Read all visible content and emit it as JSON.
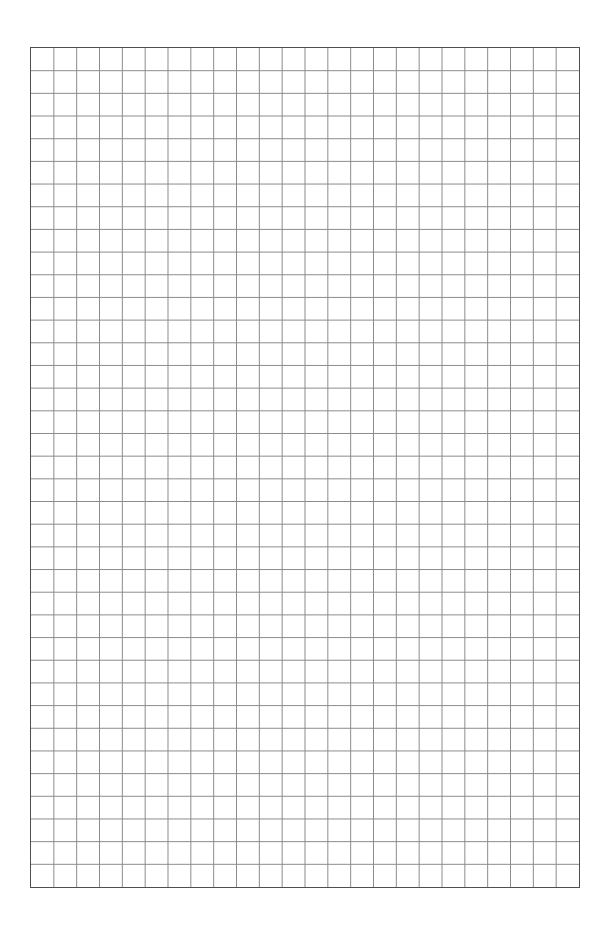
{
  "document": {
    "type": "graph-paper",
    "grid": {
      "columns": 24,
      "rows": 37,
      "left": 30,
      "top": 47,
      "width": 550,
      "height": 841,
      "line_color": "#8c8c8c",
      "border_color": "#4f4f4f",
      "background": "#ffffff"
    }
  }
}
